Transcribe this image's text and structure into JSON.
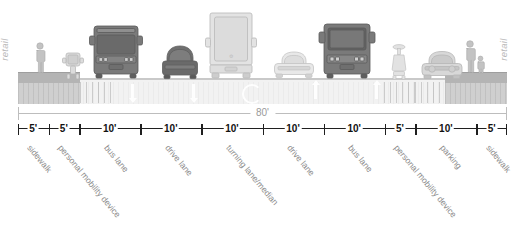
{
  "diagram": {
    "total_width_label": "80'",
    "context_left_label": "retail",
    "context_right_label": "retail",
    "colors": {
      "ink": "#1f1f1f",
      "dim_line": "#bdbdbd",
      "label_text": "#8c8c8c",
      "pavement": "#f2f2f2",
      "curb": "#b4b4b4",
      "vehicle_dark": "#6e6e6e",
      "vehicle_light": "#d5d5d5",
      "marking": "#ffffff"
    },
    "segments": [
      {
        "width_label": "5'",
        "zone_label": "sidewalk",
        "feet": 5,
        "start_ft": 0
      },
      {
        "width_label": "5'",
        "zone_label": "personal mobility device",
        "feet": 5,
        "start_ft": 5
      },
      {
        "width_label": "10'",
        "zone_label": "bus lane",
        "feet": 10,
        "start_ft": 10
      },
      {
        "width_label": "10'",
        "zone_label": "drive lane",
        "feet": 10,
        "start_ft": 20
      },
      {
        "width_label": "10'",
        "zone_label": "turning lane/median",
        "feet": 10,
        "start_ft": 30
      },
      {
        "width_label": "10'",
        "zone_label": "drive lane",
        "feet": 10,
        "start_ft": 40
      },
      {
        "width_label": "10'",
        "zone_label": "bus lane",
        "feet": 10,
        "start_ft": 50
      },
      {
        "width_label": "5'",
        "zone_label": "personal mobility device",
        "feet": 5,
        "start_ft": 60
      },
      {
        "width_label": "10'",
        "zone_label": "parking",
        "feet": 10,
        "start_ft": 65
      },
      {
        "width_label": "5'",
        "zone_label": "sidewalk",
        "feet": 5,
        "start_ft": 75
      }
    ],
    "occupants": [
      {
        "name": "pedestrian",
        "zone": "sidewalk"
      },
      {
        "name": "personal-mobility-device",
        "zone": "personal mobility device"
      },
      {
        "name": "bus",
        "zone": "bus lane"
      },
      {
        "name": "car",
        "zone": "drive lane"
      },
      {
        "name": "truck",
        "zone": "turning lane/median"
      },
      {
        "name": "car",
        "zone": "drive lane"
      },
      {
        "name": "bus",
        "zone": "bus lane"
      },
      {
        "name": "personal-mobility-device",
        "zone": "personal mobility device"
      },
      {
        "name": "parked-car",
        "zone": "parking"
      },
      {
        "name": "pedestrian-with-child",
        "zone": "sidewalk"
      }
    ],
    "markings": [
      {
        "name": "lane-arrow-down",
        "zone": "bus lane"
      },
      {
        "name": "lane-arrow-down",
        "zone": "drive lane"
      },
      {
        "name": "u-turn-marking",
        "zone": "turning lane/median"
      },
      {
        "name": "lane-arrow-up",
        "zone": "drive lane"
      },
      {
        "name": "lane-arrow-up",
        "zone": "bus lane"
      }
    ]
  }
}
